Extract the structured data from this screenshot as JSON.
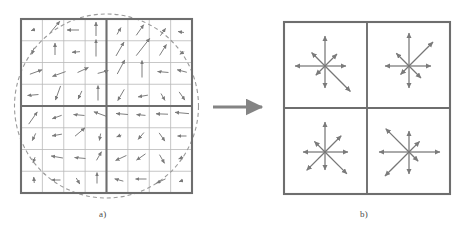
{
  "figure": {
    "background_color": "#ffffff",
    "stroke_color": "#6e6e6e",
    "thin_grid_color": "#b9b9b9",
    "arrow_color": "#777777",
    "circle_color": "#9a9a9a",
    "transition_arrow_color": "#848484",
    "width": 459,
    "height": 231
  },
  "captions": {
    "panel_a_label": "a)",
    "panel_b_label": "b)"
  },
  "panel_a": {
    "name": "image-gradients",
    "description": "8x8 array of image gradient samples with Gaussian weighting circle",
    "box": {
      "x": 21,
      "y": 19,
      "w": 171,
      "h": 174
    },
    "grid": {
      "cells_x": 8,
      "cells_y": 8,
      "thick_divisions": 2
    },
    "gaussian_window": {
      "cx": 106.5,
      "cy": 106,
      "r": 92,
      "dash": "4 3"
    },
    "gradients": [
      {
        "x": 33,
        "y": 30,
        "angle": 200,
        "len": 4
      },
      {
        "x": 55,
        "y": 27,
        "angle": 50,
        "len": 15
      },
      {
        "x": 73,
        "y": 30,
        "angle": 180,
        "len": 12
      },
      {
        "x": 96,
        "y": 29,
        "angle": 90,
        "len": 14
      },
      {
        "x": 119,
        "y": 31,
        "angle": 60,
        "len": 8
      },
      {
        "x": 140,
        "y": 30,
        "angle": 55,
        "len": 13
      },
      {
        "x": 163,
        "y": 32,
        "angle": 55,
        "len": 9
      },
      {
        "x": 181,
        "y": 32,
        "angle": 170,
        "len": 6
      },
      {
        "x": 33,
        "y": 51,
        "angle": 250,
        "len": 7
      },
      {
        "x": 55,
        "y": 49,
        "angle": 90,
        "len": 12
      },
      {
        "x": 76,
        "y": 52,
        "angle": 185,
        "len": 8
      },
      {
        "x": 96,
        "y": 48,
        "angle": 90,
        "len": 17
      },
      {
        "x": 120,
        "y": 49,
        "angle": 60,
        "len": 16
      },
      {
        "x": 143,
        "y": 47,
        "angle": 52,
        "len": 22
      },
      {
        "x": 163,
        "y": 50,
        "angle": 58,
        "len": 13
      },
      {
        "x": 182,
        "y": 53,
        "angle": 210,
        "len": 5
      },
      {
        "x": 36,
        "y": 72,
        "angle": 20,
        "len": 13
      },
      {
        "x": 59,
        "y": 74,
        "angle": 200,
        "len": 14
      },
      {
        "x": 83,
        "y": 70,
        "angle": 25,
        "len": 12
      },
      {
        "x": 103,
        "y": 72,
        "angle": 15,
        "len": 11
      },
      {
        "x": 121,
        "y": 67,
        "angle": 62,
        "len": 16
      },
      {
        "x": 142,
        "y": 69,
        "angle": 90,
        "len": 17
      },
      {
        "x": 163,
        "y": 72,
        "angle": 175,
        "len": 11
      },
      {
        "x": 182,
        "y": 71,
        "angle": 165,
        "len": 10
      },
      {
        "x": 33,
        "y": 95,
        "angle": 185,
        "len": 11
      },
      {
        "x": 58,
        "y": 93,
        "angle": 250,
        "len": 15
      },
      {
        "x": 80,
        "y": 95,
        "angle": 245,
        "len": 9
      },
      {
        "x": 98,
        "y": 93,
        "angle": 90,
        "len": 15
      },
      {
        "x": 121,
        "y": 95,
        "angle": 240,
        "len": 13
      },
      {
        "x": 143,
        "y": 96,
        "angle": 190,
        "len": 10
      },
      {
        "x": 163,
        "y": 97,
        "angle": 300,
        "len": 8
      },
      {
        "x": 182,
        "y": 96,
        "angle": 305,
        "len": 10
      },
      {
        "x": 33,
        "y": 118,
        "angle": 55,
        "len": 15
      },
      {
        "x": 57,
        "y": 117,
        "angle": 200,
        "len": 10
      },
      {
        "x": 79,
        "y": 115,
        "angle": 175,
        "len": 11
      },
      {
        "x": 100,
        "y": 114,
        "angle": 160,
        "len": 13
      },
      {
        "x": 122,
        "y": 114,
        "angle": 175,
        "len": 12
      },
      {
        "x": 141,
        "y": 115,
        "angle": 175,
        "len": 9
      },
      {
        "x": 162,
        "y": 114,
        "angle": 178,
        "len": 12
      },
      {
        "x": 182,
        "y": 113,
        "angle": 175,
        "len": 14
      },
      {
        "x": 34,
        "y": 137,
        "angle": 245,
        "len": 8
      },
      {
        "x": 57,
        "y": 135,
        "angle": 190,
        "len": 10
      },
      {
        "x": 80,
        "y": 132,
        "angle": 40,
        "len": 13
      },
      {
        "x": 100,
        "y": 137,
        "angle": 260,
        "len": 7
      },
      {
        "x": 119,
        "y": 136,
        "angle": 200,
        "len": 5
      },
      {
        "x": 141,
        "y": 136,
        "angle": 230,
        "len": 9
      },
      {
        "x": 162,
        "y": 137,
        "angle": 305,
        "len": 10
      },
      {
        "x": 182,
        "y": 136,
        "angle": 180,
        "len": 9
      },
      {
        "x": 34,
        "y": 160,
        "angle": 250,
        "len": 6
      },
      {
        "x": 57,
        "y": 157,
        "angle": 170,
        "len": 12
      },
      {
        "x": 80,
        "y": 158,
        "angle": 175,
        "len": 11
      },
      {
        "x": 99,
        "y": 156,
        "angle": 60,
        "len": 10
      },
      {
        "x": 121,
        "y": 158,
        "angle": 205,
        "len": 12
      },
      {
        "x": 141,
        "y": 157,
        "angle": 215,
        "len": 11
      },
      {
        "x": 162,
        "y": 159,
        "angle": 300,
        "len": 10
      },
      {
        "x": 181,
        "y": 158,
        "angle": 200,
        "len": 5
      },
      {
        "x": 34,
        "y": 180,
        "angle": 95,
        "len": 6
      },
      {
        "x": 56,
        "y": 180,
        "angle": 180,
        "len": 9
      },
      {
        "x": 78,
        "y": 181,
        "angle": 300,
        "len": 7
      },
      {
        "x": 97,
        "y": 178,
        "angle": 90,
        "len": 11
      },
      {
        "x": 119,
        "y": 180,
        "angle": 165,
        "len": 9
      },
      {
        "x": 141,
        "y": 179,
        "angle": 180,
        "len": 11
      },
      {
        "x": 161,
        "y": 181,
        "angle": 205,
        "len": 10
      },
      {
        "x": 181,
        "y": 181,
        "angle": 200,
        "len": 4
      }
    ]
  },
  "transition": {
    "name": "transition-arrow",
    "x1": 213,
    "y1": 107,
    "x2": 262,
    "y2": 107
  },
  "panel_b": {
    "name": "keypoint-descriptor",
    "description": "2x2 array of 8-bin orientation histograms",
    "box": {
      "x": 284,
      "y": 22,
      "w": 166,
      "h": 172
    },
    "grid": {
      "cells_x": 2,
      "cells_y": 2
    },
    "bin_angles": [
      0,
      45,
      90,
      135,
      180,
      225,
      270,
      315
    ],
    "histograms": [
      {
        "cell": "top-left",
        "cx": 325,
        "cy": 66,
        "magnitudes": [
          21,
          17,
          30,
          19,
          30,
          13,
          22,
          36
        ]
      },
      {
        "cell": "top-right",
        "cx": 409,
        "cy": 66,
        "magnitudes": [
          22,
          34,
          33,
          18,
          24,
          12,
          22,
          17
        ]
      },
      {
        "cell": "bottom-left",
        "cx": 325,
        "cy": 152,
        "magnitudes": [
          23,
          23,
          30,
          15,
          22,
          26,
          18,
          31
        ]
      },
      {
        "cell": "bottom-right",
        "cx": 409,
        "cy": 152,
        "magnitudes": [
          31,
          15,
          21,
          33,
          30,
          34,
          22,
          13
        ]
      }
    ]
  }
}
